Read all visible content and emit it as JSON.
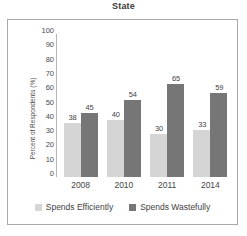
{
  "chart_data": {
    "type": "bar",
    "title": "State",
    "xlabel": "",
    "ylabel": "Percent of Respondents (%)",
    "categories": [
      "2008",
      "2010",
      "2011",
      "2014"
    ],
    "series": [
      {
        "name": "Spends Efficiently",
        "color": "#d5d5d5",
        "values": [
          38,
          40,
          30,
          33
        ]
      },
      {
        "name": "Spends Wastefully",
        "color": "#767676",
        "values": [
          45,
          54,
          65,
          59
        ]
      }
    ],
    "ylim": [
      0,
      100
    ],
    "ytick_labels": [
      "100",
      "90",
      "80",
      "70",
      "60",
      "50",
      "40",
      "30",
      "20",
      "10",
      "0"
    ],
    "ytick_values": [
      100,
      90,
      80,
      70,
      60,
      50,
      40,
      30,
      20,
      10,
      0
    ],
    "grid": false,
    "legend_position": "bottom",
    "data_labels": true
  },
  "caption_fragment": ""
}
